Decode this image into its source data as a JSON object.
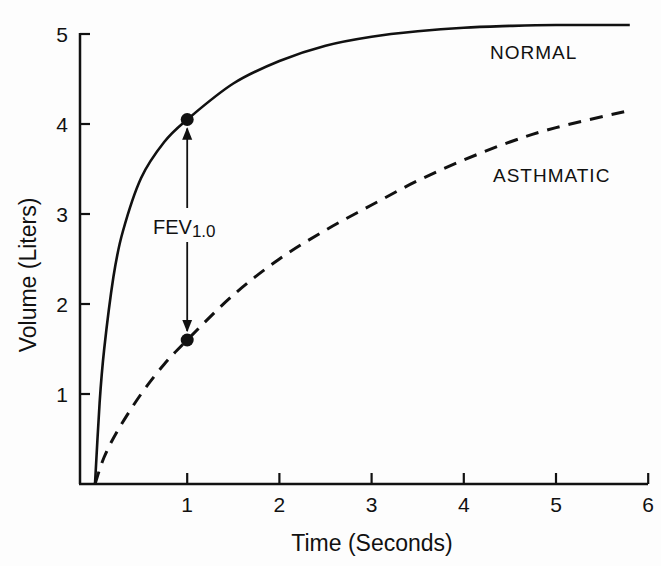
{
  "chart_data": {
    "type": "line",
    "title": "",
    "xlabel": "Time (Seconds)",
    "ylabel": "Volume (Liters)",
    "xlim": [
      0,
      6
    ],
    "ylim": [
      0,
      5
    ],
    "xticks": [
      "1",
      "2",
      "3",
      "4",
      "5",
      "6"
    ],
    "yticks": [
      "1",
      "2",
      "3",
      "4",
      "5"
    ],
    "grid": false,
    "legend": "inline labels",
    "series": [
      {
        "name": "NORMAL",
        "style": "solid",
        "x": [
          0,
          0.05,
          0.1,
          0.2,
          0.3,
          0.5,
          0.75,
          1,
          1.5,
          2,
          2.5,
          3,
          3.5,
          4,
          4.5,
          5,
          5.8
        ],
        "values": [
          0,
          0.9,
          1.5,
          2.3,
          2.8,
          3.4,
          3.8,
          4.05,
          4.45,
          4.7,
          4.87,
          4.97,
          5.03,
          5.07,
          5.09,
          5.1,
          5.1
        ]
      },
      {
        "name": "ASTHMATIC",
        "style": "dashed",
        "x": [
          0,
          0.1,
          0.25,
          0.5,
          0.75,
          1,
          1.5,
          2,
          2.5,
          3,
          3.5,
          4,
          4.5,
          5,
          5.8
        ],
        "values": [
          0,
          0.3,
          0.6,
          1.0,
          1.33,
          1.6,
          2.1,
          2.5,
          2.82,
          3.1,
          3.37,
          3.6,
          3.8,
          3.96,
          4.15
        ]
      }
    ],
    "annotations": [
      {
        "text": "FEV",
        "subscript": "1.0",
        "type": "double-arrow",
        "x": 1,
        "from": 4.05,
        "to": 1.6
      }
    ],
    "markers": [
      {
        "series": "NORMAL",
        "x": 1,
        "y": 4.05
      },
      {
        "series": "ASTHMATIC",
        "x": 1,
        "y": 1.6
      }
    ]
  },
  "labels": {
    "normal": "NORMAL",
    "asthmatic": "ASTHMATIC",
    "fev_main": "FEV",
    "fev_sub": "1.0",
    "xlabel": "Time (Seconds)",
    "ylabel": "Volume (Liters)"
  },
  "colors": {
    "ink": "#111111",
    "background": "#fdfdfd"
  }
}
